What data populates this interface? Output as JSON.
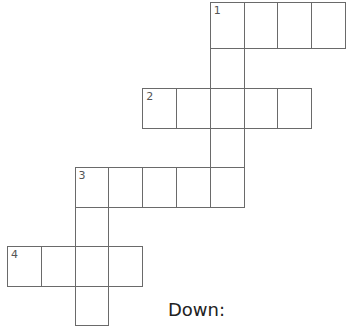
{
  "puzzle": {
    "type": "crossword",
    "grid": {
      "origin_x": 7,
      "origin_y": 2,
      "cell_w": 33.8,
      "row_tops": [
        2,
        48,
        88,
        128,
        167,
        207,
        246,
        286,
        323
      ],
      "cells": [
        {
          "row": 0,
          "col": 6,
          "num": "1"
        },
        {
          "row": 0,
          "col": 7
        },
        {
          "row": 0,
          "col": 8
        },
        {
          "row": 0,
          "col": 9
        },
        {
          "row": 1,
          "col": 6
        },
        {
          "row": 2,
          "col": 4,
          "num": "2"
        },
        {
          "row": 2,
          "col": 5
        },
        {
          "row": 2,
          "col": 6
        },
        {
          "row": 2,
          "col": 7
        },
        {
          "row": 2,
          "col": 8
        },
        {
          "row": 3,
          "col": 6
        },
        {
          "row": 4,
          "col": 2,
          "num": "3"
        },
        {
          "row": 4,
          "col": 3
        },
        {
          "row": 4,
          "col": 4
        },
        {
          "row": 4,
          "col": 5
        },
        {
          "row": 4,
          "col": 6
        },
        {
          "row": 5,
          "col": 2
        },
        {
          "row": 6,
          "col": 0,
          "num": "4"
        },
        {
          "row": 6,
          "col": 1
        },
        {
          "row": 6,
          "col": 2
        },
        {
          "row": 6,
          "col": 3
        },
        {
          "row": 7,
          "col": 2
        }
      ]
    },
    "clues": {
      "down_heading": "Down:"
    }
  }
}
